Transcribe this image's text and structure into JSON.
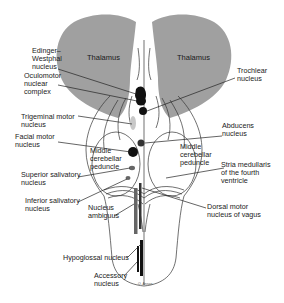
{
  "diagram": {
    "colors": {
      "thalamus_fill": "#a0a0a0",
      "nucleus_dark": "#111111",
      "nucleus_gray": "#666666",
      "nucleus_light": "#c8c8c8",
      "outline": "#333333",
      "background": "#ffffff"
    },
    "structures": {
      "thalamus_left": "Thalamus",
      "thalamus_right": "Thalamus",
      "mcp_left": [
        "Middle",
        "cerebellar",
        "peduncle"
      ],
      "mcp_right": [
        "Middle",
        "cerebellar",
        "peduncle"
      ]
    },
    "labels_left": {
      "edinger_westphal": [
        "Edinger–",
        "Westphal",
        "nucleus"
      ],
      "oculomotor": [
        "Oculomotor",
        "nuclear",
        "complex"
      ],
      "trigeminal_motor": [
        "Trigeminal motor",
        "nucleus"
      ],
      "facial_motor": [
        "Facial motor",
        "nucleus"
      ],
      "superior_salivatory": [
        "Superior salivatory",
        "nucleus"
      ],
      "inferior_salivatory": [
        "Inferior salivatory",
        "nucleus"
      ],
      "nucleus_ambiguus": [
        "Nucleus",
        "ambiguus"
      ],
      "hypoglossal": [
        "Hypoglossal nucleus"
      ],
      "accessory": [
        "Accessory",
        "nucleus"
      ]
    },
    "labels_right": {
      "trochlear": [
        "Trochlear",
        "nucleus"
      ],
      "abducens": [
        "Abducens",
        "nucleus"
      ],
      "stria_medullaris": [
        "Stria medullaris",
        "of the fourth",
        "ventricle"
      ],
      "dorsal_motor_vagus": [
        "Dorsal motor",
        "nucleus of vagus"
      ]
    },
    "signature": "O. Ansan"
  }
}
